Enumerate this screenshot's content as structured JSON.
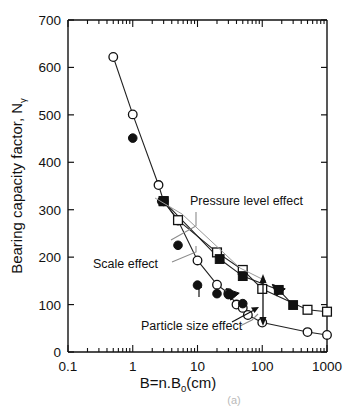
{
  "chart_data": {
    "type": "line",
    "title": "",
    "xlabel": "B=n.B0(cm)",
    "xlabel_main": "B=n.B",
    "xlabel_sub": "0",
    "xlabel_tail": "(cm)",
    "ylabel_main": "Bearing capacity factor, N",
    "ylabel_sub": "γ",
    "xscale": "log",
    "xlim": [
      0.1,
      1000
    ],
    "ylim": [
      0,
      700
    ],
    "ytick_labels": [
      "0",
      "100",
      "200",
      "300",
      "400",
      "500",
      "600",
      "700"
    ],
    "yticks": [
      0,
      100,
      200,
      300,
      400,
      500,
      600,
      700
    ],
    "xtick_labels": [
      "0.1",
      "1",
      "10",
      "100",
      "1000"
    ],
    "xticks": [
      0.1,
      1,
      10,
      100,
      1000
    ],
    "grid": false,
    "legend": "none",
    "series": [
      {
        "name": "open-circle",
        "marker": "open-circle",
        "line": true,
        "points": [
          {
            "x": 0.5,
            "y": 622
          },
          {
            "x": 1.0,
            "y": 501
          },
          {
            "x": 2.5,
            "y": 352
          },
          {
            "x": 3.0,
            "y": 318
          },
          {
            "x": 5.0,
            "y": 277
          },
          {
            "x": 10.0,
            "y": 193
          },
          {
            "x": 20.0,
            "y": 142
          },
          {
            "x": 30.0,
            "y": 124
          },
          {
            "x": 40.0,
            "y": 100
          },
          {
            "x": 50.0,
            "y": 93
          },
          {
            "x": 60.0,
            "y": 78
          },
          {
            "x": 100.0,
            "y": 62
          },
          {
            "x": 500.0,
            "y": 42
          },
          {
            "x": 1000.0,
            "y": 36
          }
        ]
      },
      {
        "name": "filled-circle",
        "marker": "filled-circle",
        "line": false,
        "points": [
          {
            "x": 1.0,
            "y": 451
          },
          {
            "x": 2.8,
            "y": 318
          },
          {
            "x": 5.0,
            "y": 225
          },
          {
            "x": 10.0,
            "y": 141
          },
          {
            "x": 20.0,
            "y": 123
          },
          {
            "x": 30.0,
            "y": 121
          },
          {
            "x": 50.0,
            "y": 102
          }
        ]
      },
      {
        "name": "open-square",
        "marker": "open-square",
        "line": true,
        "points": [
          {
            "x": 3.0,
            "y": 318
          },
          {
            "x": 5.0,
            "y": 278
          },
          {
            "x": 20.0,
            "y": 210
          },
          {
            "x": 50.0,
            "y": 173
          },
          {
            "x": 100.0,
            "y": 133
          },
          {
            "x": 500.0,
            "y": 89
          },
          {
            "x": 1000.0,
            "y": 85
          }
        ]
      },
      {
        "name": "filled-square",
        "marker": "filled-square",
        "line": true,
        "points": [
          {
            "x": 3.0,
            "y": 318
          },
          {
            "x": 22.0,
            "y": 196
          },
          {
            "x": 50.0,
            "y": 160
          },
          {
            "x": 180.0,
            "y": 131
          },
          {
            "x": 300.0,
            "y": 99
          }
        ]
      },
      {
        "name": "filled-triangle",
        "marker": "filled-triangle",
        "line": false,
        "points": [
          {
            "x": 35.0,
            "y": 122
          },
          {
            "x": 180.0,
            "y": 131
          }
        ]
      }
    ],
    "annotations": [
      {
        "text": "Pressure level effect",
        "x_px": 190,
        "y_px": 205
      },
      {
        "text": "Scale effect",
        "x_px": 93,
        "y_px": 268
      },
      {
        "text": "Particle size effect",
        "x_px": 141,
        "y_px": 330
      }
    ],
    "caption": "(a)"
  }
}
